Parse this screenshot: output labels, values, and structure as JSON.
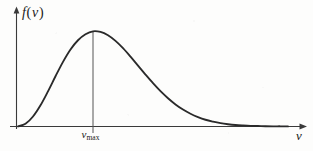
{
  "figure": {
    "background_color": "#fdfdfc",
    "stroke_color": "#2a2a2a",
    "axis_color": "#3a3a3a",
    "width": 313,
    "height": 151
  },
  "labels": {
    "y_axis_function": "f",
    "y_axis_open_paren": "(",
    "y_axis_variable": "v",
    "y_axis_close_paren": ")",
    "x_axis_variable": "v",
    "peak_tick_variable": "v",
    "peak_tick_subscript": "max"
  },
  "chart_data": {
    "type": "line",
    "title": "",
    "subtitle": "",
    "xlabel": "v",
    "ylabel": "f(v)",
    "grid": false,
    "legend": null,
    "annotations": [
      {
        "name": "peak-dropline",
        "kind": "vertical-line",
        "x": 1.0,
        "y_from": 0.0,
        "y_to": 1.0,
        "label": "v_max"
      }
    ],
    "axes": {
      "x_arrow": true,
      "y_arrow": true,
      "xlim": [
        0,
        3.6
      ],
      "ylim": [
        0,
        1.12
      ],
      "x_ticks": [
        1.0
      ],
      "x_tick_labels": [
        "v_max"
      ],
      "y_ticks": [],
      "y_tick_labels": []
    },
    "series": [
      {
        "name": "Maxwell-Boltzmann speed distribution",
        "x": [
          0.0,
          0.1,
          0.2,
          0.3,
          0.4,
          0.5,
          0.6,
          0.7,
          0.8,
          0.9,
          1.0,
          1.1,
          1.2,
          1.3,
          1.4,
          1.5,
          1.6,
          1.7,
          1.8,
          1.9,
          2.0,
          2.1,
          2.2,
          2.3,
          2.4,
          2.5,
          2.6,
          2.7,
          2.8,
          2.9,
          3.0,
          3.1,
          3.2,
          3.3,
          3.4,
          3.5,
          3.6
        ],
        "y": [
          0.0,
          0.027,
          0.104,
          0.222,
          0.369,
          0.527,
          0.679,
          0.809,
          0.906,
          0.969,
          1.0,
          0.993,
          0.958,
          0.899,
          0.822,
          0.733,
          0.639,
          0.545,
          0.454,
          0.37,
          0.296,
          0.231,
          0.177,
          0.133,
          0.098,
          0.07,
          0.05,
          0.034,
          0.023,
          0.015,
          0.01,
          0.006,
          0.004,
          0.002,
          0.001,
          0.001,
          0.0
        ]
      }
    ]
  }
}
